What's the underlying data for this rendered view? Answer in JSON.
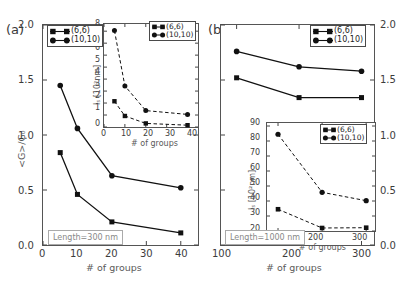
{
  "figure": {
    "background": "#ffffff",
    "line_color": "#111111",
    "marker_color": "#111111"
  },
  "panels": [
    {
      "id": "a",
      "label": "(a)",
      "annotation": "Length=300 nm",
      "legend": [
        {
          "label": "(6,6)",
          "marker": "square"
        },
        {
          "label": "(10,10)",
          "marker": "circle"
        }
      ],
      "main": {
        "xlabel": "# of groups",
        "ylabel": "<G>/G₀",
        "xticks": [
          "0",
          "10",
          "20",
          "30",
          "40"
        ],
        "yticks": [
          "0.0",
          "0.5",
          "1.0",
          "1.5",
          "2.0"
        ]
      },
      "inset": {
        "xlabel": "# of groups",
        "ylabel": "lₛ [10²nm]",
        "xticks": [
          "0",
          "10",
          "20",
          "30",
          "40"
        ],
        "yticks": [
          "0",
          "1",
          "2",
          "3",
          "4",
          "5",
          "6",
          "7",
          "8"
        ],
        "legend": [
          {
            "label": "(6,6)",
            "marker": "square"
          },
          {
            "label": "(10,10)",
            "marker": "circle"
          }
        ]
      }
    },
    {
      "id": "b",
      "label": "(b)",
      "annotation": "Length=1000 nm",
      "legend": [
        {
          "label": "(6,6)",
          "marker": "square"
        },
        {
          "label": "(10,10)",
          "marker": "circle"
        }
      ],
      "main": {
        "xlabel": "# of groups",
        "ylabel": "",
        "xticks": [
          "100",
          "200",
          "300"
        ],
        "yticks": [
          "0.0",
          "0.5",
          "1.0",
          "1.5",
          "2.0"
        ]
      },
      "inset": {
        "xlabel": "# of groups",
        "ylabel": "lₛ [10²nm]",
        "xticks": [
          "100",
          "200",
          "300"
        ],
        "yticks": [
          "20",
          "30",
          "40",
          "50",
          "60",
          "70",
          "80",
          "90"
        ],
        "legend": [
          {
            "label": "(6,6)",
            "marker": "square"
          },
          {
            "label": "(10,10)",
            "marker": "circle"
          }
        ]
      }
    }
  ],
  "chart_data": [
    {
      "id": "panel-a-main",
      "type": "line",
      "title": "(a)",
      "xlabel": "# of groups",
      "ylabel": "<G>/G₀",
      "xlim": [
        0,
        45
      ],
      "ylim": [
        0.0,
        2.0
      ],
      "xticks": [
        0,
        10,
        20,
        30,
        40
      ],
      "yticks": [
        0.0,
        0.5,
        1.0,
        1.5,
        2.0
      ],
      "grid": false,
      "legend_position": "upper-left",
      "annotation": "Length=300 nm",
      "linestyle": "solid",
      "series": [
        {
          "name": "(6,6)",
          "marker": "square",
          "x": [
            5,
            10,
            20,
            40
          ],
          "values": [
            0.84,
            0.46,
            0.21,
            0.11
          ]
        },
        {
          "name": "(10,10)",
          "marker": "circle",
          "x": [
            5,
            10,
            20,
            40
          ],
          "values": [
            1.45,
            1.06,
            0.63,
            0.52
          ]
        }
      ]
    },
    {
      "id": "panel-a-inset",
      "type": "line",
      "title": "",
      "xlabel": "# of groups",
      "ylabel": "lₛ [10²nm]",
      "xlim": [
        0,
        45
      ],
      "ylim": [
        0,
        8.6
      ],
      "xticks": [
        0,
        10,
        20,
        30,
        40
      ],
      "yticks": [
        0,
        1,
        2,
        3,
        4,
        5,
        6,
        7,
        8
      ],
      "grid": false,
      "legend_position": "upper-right",
      "linestyle": "dashed",
      "series": [
        {
          "name": "(6,6)",
          "marker": "square",
          "x": [
            5,
            10,
            20,
            40
          ],
          "values": [
            2.15,
            0.92,
            0.3,
            0.15
          ]
        },
        {
          "name": "(10,10)",
          "marker": "circle",
          "x": [
            5,
            10,
            20,
            40
          ],
          "values": [
            8.05,
            3.43,
            1.37,
            1.05
          ]
        }
      ]
    },
    {
      "id": "panel-b-main",
      "type": "line",
      "title": "(b)",
      "xlabel": "# of groups",
      "ylabel": "",
      "xlim": [
        75,
        320
      ],
      "ylim": [
        0.0,
        2.0
      ],
      "xticks": [
        100,
        200,
        300
      ],
      "yticks": [
        0.0,
        0.5,
        1.0,
        1.5,
        2.0
      ],
      "grid": false,
      "legend_position": "upper-right",
      "annotation": "Length=1000 nm",
      "linestyle": "solid",
      "series": [
        {
          "name": "(6,6)",
          "marker": "square",
          "x": [
            100,
            200,
            300
          ],
          "values": [
            1.52,
            1.34,
            1.34
          ]
        },
        {
          "name": "(10,10)",
          "marker": "circle",
          "x": [
            100,
            200,
            300
          ],
          "values": [
            1.76,
            1.62,
            1.58
          ]
        }
      ]
    },
    {
      "id": "panel-b-inset",
      "type": "line",
      "title": "",
      "xlabel": "# of groups",
      "ylabel": "lₛ [10²nm]",
      "xlim": [
        75,
        320
      ],
      "ylim": [
        20,
        92
      ],
      "xticks": [
        100,
        200,
        300
      ],
      "yticks": [
        20,
        30,
        40,
        50,
        60,
        70,
        80,
        90
      ],
      "grid": false,
      "legend_position": "upper-right",
      "linestyle": "dashed",
      "series": [
        {
          "name": "(6,6)",
          "marker": "square",
          "x": [
            100,
            200,
            300
          ],
          "values": [
            34.5,
            22.0,
            22.2
          ]
        },
        {
          "name": "(10,10)",
          "marker": "circle",
          "x": [
            100,
            200,
            300
          ],
          "values": [
            84.5,
            45.8,
            40.2
          ]
        }
      ]
    }
  ]
}
